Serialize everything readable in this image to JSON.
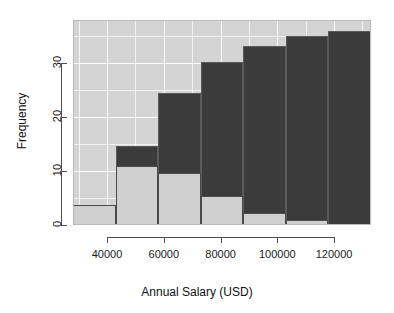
{
  "chart_data": {
    "type": "bar",
    "title": "",
    "subtitle": "",
    "xlabel": "Annual Salary (USD)",
    "ylabel": "Frequency",
    "xlim": [
      28000,
      133000
    ],
    "ylim": [
      0,
      38
    ],
    "grid": true,
    "legend": "none",
    "stacked": true,
    "bin_width": 15000,
    "bin_edges": [
      28000,
      43000,
      58000,
      73000,
      88000,
      103000,
      118000,
      133000
    ],
    "categories": [
      "28000-43000",
      "43000-58000",
      "58000-73000",
      "73000-88000",
      "88000-103000",
      "103000-118000",
      "118000-133000"
    ],
    "series": [
      {
        "name": "light",
        "color": "#d0d0d0",
        "values": [
          3.8,
          11.0,
          9.6,
          5.4,
          2.2,
          1.0,
          0.0
        ]
      },
      {
        "name": "dark",
        "color": "#3b3b3b",
        "values": [
          0.0,
          14.7,
          24.5,
          30.3,
          33.2,
          35.1,
          36.0
        ]
      }
    ],
    "xticks": [
      {
        "value": 40000,
        "label": "40000"
      },
      {
        "value": 60000,
        "label": "60000"
      },
      {
        "value": 80000,
        "label": "80000"
      },
      {
        "value": 100000,
        "label": "100000"
      },
      {
        "value": 120000,
        "label": "120000"
      }
    ],
    "yticks": [
      {
        "value": 0,
        "label": "0"
      },
      {
        "value": 10,
        "label": "10"
      },
      {
        "value": 20,
        "label": "20"
      },
      {
        "value": 30,
        "label": "30"
      }
    ],
    "panel_background": "#d4d4d4",
    "grid_color": "#fdfdfd",
    "axis_color": "#4d4d4d",
    "figure_background": "#ffffff"
  }
}
